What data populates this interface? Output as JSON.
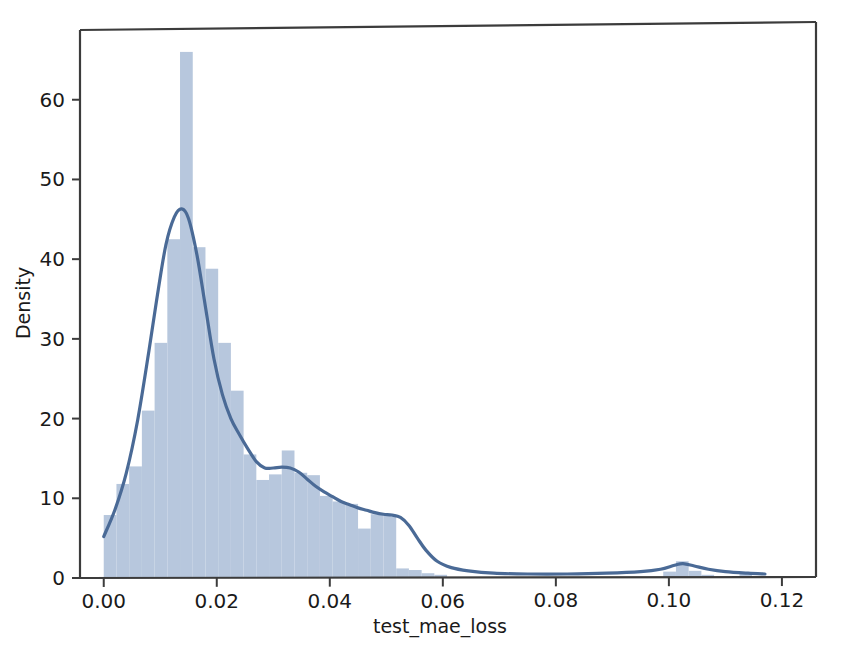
{
  "figure": {
    "background_color": "#ffffff",
    "partial_top_text": "",
    "plot_area": {
      "x0": 80,
      "y0": 28,
      "x1": 800,
      "y1": 578
    },
    "spine_color": "#3c3c3c"
  },
  "chart_data": {
    "type": "bar",
    "subtype": "histogram-with-kde",
    "title": "",
    "xlabel": "test_mae_loss",
    "ylabel": "Density",
    "xlim": [
      -0.0042,
      0.1232
    ],
    "ylim": [
      0,
      69
    ],
    "grid": false,
    "legend": null,
    "colors": {
      "bar_fill": "#b7c7dd",
      "kde_line": "#4a6a96",
      "axis": "#3c3c3c",
      "text": "#1a1a1a"
    },
    "xticks": [
      0.0,
      0.02,
      0.04,
      0.06,
      0.08,
      0.1,
      0.12
    ],
    "xticklabels": [
      "0.00",
      "0.02",
      "0.04",
      "0.06",
      "0.08",
      "0.10",
      "0.12"
    ],
    "yticks": [
      0,
      10,
      20,
      30,
      40,
      50,
      60
    ],
    "yticklabels": [
      "0",
      "10",
      "20",
      "30",
      "40",
      "50",
      "60"
    ],
    "bin_width": 0.00225,
    "bins": [
      {
        "x0": 0.0,
        "x1": 0.00225,
        "height": 7.9
      },
      {
        "x0": 0.00225,
        "x1": 0.0045,
        "height": 11.8
      },
      {
        "x0": 0.0045,
        "x1": 0.00675,
        "height": 14.0
      },
      {
        "x0": 0.00675,
        "x1": 0.009,
        "height": 21.0
      },
      {
        "x0": 0.009,
        "x1": 0.01125,
        "height": 29.5
      },
      {
        "x0": 0.01125,
        "x1": 0.0135,
        "height": 42.5
      },
      {
        "x0": 0.0135,
        "x1": 0.01575,
        "height": 66.0
      },
      {
        "x0": 0.01575,
        "x1": 0.018,
        "height": 41.5
      },
      {
        "x0": 0.018,
        "x1": 0.02025,
        "height": 38.8
      },
      {
        "x0": 0.02025,
        "x1": 0.0225,
        "height": 29.5
      },
      {
        "x0": 0.0225,
        "x1": 0.02475,
        "height": 23.5
      },
      {
        "x0": 0.02475,
        "x1": 0.027,
        "height": 15.5
      },
      {
        "x0": 0.027,
        "x1": 0.02925,
        "height": 12.3
      },
      {
        "x0": 0.02925,
        "x1": 0.0315,
        "height": 13.0
      },
      {
        "x0": 0.0315,
        "x1": 0.03375,
        "height": 16.0
      },
      {
        "x0": 0.03375,
        "x1": 0.036,
        "height": 13.2
      },
      {
        "x0": 0.036,
        "x1": 0.03825,
        "height": 12.9
      },
      {
        "x0": 0.03825,
        "x1": 0.0405,
        "height": 10.3
      },
      {
        "x0": 0.0405,
        "x1": 0.04275,
        "height": 9.6
      },
      {
        "x0": 0.04275,
        "x1": 0.045,
        "height": 9.3
      },
      {
        "x0": 0.045,
        "x1": 0.04725,
        "height": 6.2
      },
      {
        "x0": 0.04725,
        "x1": 0.0495,
        "height": 8.0
      },
      {
        "x0": 0.0495,
        "x1": 0.05175,
        "height": 8.0
      },
      {
        "x0": 0.05175,
        "x1": 0.054,
        "height": 1.2
      },
      {
        "x0": 0.054,
        "x1": 0.05625,
        "height": 1.0
      },
      {
        "x0": 0.05625,
        "x1": 0.0585,
        "height": 0.6
      },
      {
        "x0": 0.0585,
        "x1": 0.06075,
        "height": 0.4
      },
      {
        "x0": 0.06075,
        "x1": 0.063,
        "height": 0.0
      },
      {
        "x0": 0.099,
        "x1": 0.10125,
        "height": 0.8
      },
      {
        "x0": 0.10125,
        "x1": 0.1035,
        "height": 2.1
      },
      {
        "x0": 0.1035,
        "x1": 0.10575,
        "height": 0.9
      },
      {
        "x0": 0.10575,
        "x1": 0.108,
        "height": 0.4
      },
      {
        "x0": 0.1125,
        "x1": 0.1147,
        "height": 0.5
      }
    ],
    "kde": {
      "name": "Density estimate",
      "x": [
        0.0,
        0.002,
        0.004,
        0.006,
        0.008,
        0.0095,
        0.011,
        0.0125,
        0.0138,
        0.015,
        0.0165,
        0.018,
        0.0195,
        0.021,
        0.0225,
        0.024,
        0.0255,
        0.027,
        0.0285,
        0.03,
        0.0315,
        0.033,
        0.0345,
        0.036,
        0.0375,
        0.039,
        0.0405,
        0.042,
        0.0435,
        0.045,
        0.0465,
        0.048,
        0.0495,
        0.051,
        0.0525,
        0.054,
        0.0555,
        0.057,
        0.059,
        0.0615,
        0.0645,
        0.069,
        0.075,
        0.082,
        0.089,
        0.095,
        0.0985,
        0.101,
        0.1025,
        0.1045,
        0.107,
        0.11,
        0.114,
        0.117
      ],
      "y": [
        5.2,
        8.6,
        13.2,
        19.8,
        28.5,
        35.5,
        41.8,
        45.3,
        46.3,
        45.1,
        40.5,
        34.0,
        27.5,
        23.0,
        20.0,
        18.0,
        16.2,
        14.6,
        13.8,
        13.8,
        13.9,
        13.8,
        13.3,
        12.4,
        11.5,
        10.8,
        10.2,
        9.6,
        9.2,
        8.8,
        8.5,
        8.2,
        8.0,
        7.9,
        7.6,
        6.6,
        5.0,
        3.5,
        2.1,
        1.3,
        0.9,
        0.6,
        0.5,
        0.5,
        0.6,
        0.8,
        1.1,
        1.6,
        1.8,
        1.5,
        1.1,
        0.8,
        0.6,
        0.5
      ]
    }
  }
}
